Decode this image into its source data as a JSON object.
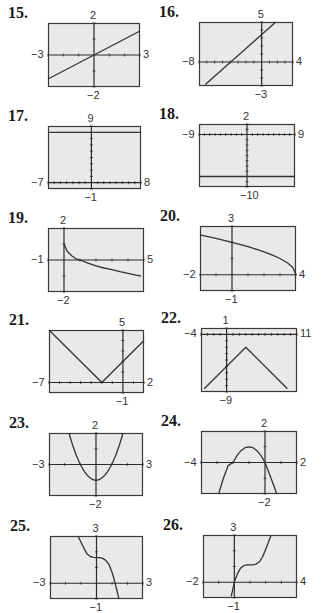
{
  "chart_data": [
    {
      "id": "15",
      "type": "line",
      "number": "15.",
      "window": {
        "xmin": -3,
        "xmax": 3,
        "ymin": -2,
        "ymax": 2
      },
      "labels": {
        "top": "2",
        "bottom": "−2",
        "left": "−3",
        "right": "3"
      },
      "frame": [
        48,
        23,
        92,
        64
      ],
      "curve": "linear",
      "points": [
        [
          -3,
          -1.5
        ],
        [
          3,
          1.5
        ]
      ]
    },
    {
      "id": "16",
      "type": "line",
      "number": "16.",
      "window": {
        "xmin": -8,
        "xmax": 4,
        "ymin": -3,
        "ymax": 5
      },
      "labels": {
        "top": "5",
        "bottom": "−3",
        "left": "−8",
        "right": "4"
      },
      "frame": [
        199,
        22,
        94,
        64
      ],
      "curve": "linear",
      "points": [
        [
          -7.2,
          -2.8
        ],
        [
          1.8,
          5
        ]
      ]
    },
    {
      "id": "17",
      "type": "line",
      "number": "17.",
      "window": {
        "xmin": -7,
        "xmax": 8,
        "ymin": -1,
        "ymax": 9
      },
      "labels": {
        "top": "9",
        "bottom": "−1",
        "left": "−7",
        "right": "8"
      },
      "frame": [
        48,
        126,
        93,
        63
      ],
      "curve": "linear",
      "points": [
        [
          -7,
          8
        ],
        [
          8,
          8
        ]
      ]
    },
    {
      "id": "18",
      "type": "line",
      "number": "18.",
      "window": {
        "xmin": -9,
        "xmax": 9,
        "ymin": -10,
        "ymax": 2
      },
      "labels": {
        "top": "2",
        "bottom": "−10",
        "left": "−9",
        "right": "9"
      },
      "frame": [
        199,
        124,
        96,
        63
      ],
      "curve": "linear",
      "points": [
        [
          -9,
          -8
        ],
        [
          9,
          -8
        ]
      ]
    },
    {
      "id": "19",
      "type": "line",
      "number": "19.",
      "window": {
        "xmin": -1,
        "xmax": 5,
        "ymin": -2,
        "ymax": 2
      },
      "labels": {
        "top": "2",
        "bottom": "−2",
        "left": "−1",
        "right": "5"
      },
      "frame": [
        48,
        228,
        96,
        64
      ],
      "curve": "points",
      "points": [
        [
          0,
          1
        ],
        [
          0.2,
          0.55
        ],
        [
          0.5,
          0.25
        ],
        [
          0.8,
          0.05
        ],
        [
          1,
          0
        ],
        [
          1.5,
          -0.2
        ],
        [
          2,
          -0.36
        ],
        [
          2.5,
          -0.5
        ],
        [
          3,
          -0.6
        ],
        [
          3.5,
          -0.73
        ],
        [
          4,
          -0.83
        ],
        [
          4.5,
          -0.95
        ],
        [
          4.8,
          -1
        ]
      ]
    },
    {
      "id": "20",
      "type": "line",
      "number": "20.",
      "window": {
        "xmin": -2,
        "xmax": 4,
        "ymin": -1,
        "ymax": 3
      },
      "labels": {
        "top": "3",
        "bottom": "−1",
        "left": "−2",
        "right": "4"
      },
      "frame": [
        200,
        226,
        96,
        65
      ],
      "curve": "points",
      "points": [
        [
          -2,
          2.45
        ],
        [
          -1,
          2.24
        ],
        [
          0,
          2
        ],
        [
          1,
          1.73
        ],
        [
          1.5,
          1.58
        ],
        [
          2,
          1.41
        ],
        [
          2.5,
          1.22
        ],
        [
          3,
          1
        ],
        [
          3.5,
          0.71
        ],
        [
          3.8,
          0.45
        ],
        [
          4,
          0
        ]
      ]
    },
    {
      "id": "21",
      "type": "line",
      "number": "21.",
      "window": {
        "xmin": -7,
        "xmax": 2,
        "ymin": -1,
        "ymax": 5
      },
      "labels": {
        "top": "5",
        "bottom": "−1",
        "left": "−7",
        "right": "2"
      },
      "frame": [
        49,
        330,
        95,
        63
      ],
      "curve": "linear",
      "points": [
        [
          -7,
          5
        ],
        [
          -2,
          0
        ],
        [
          2,
          4
        ]
      ]
    },
    {
      "id": "22",
      "type": "line",
      "number": "22.",
      "window": {
        "xmin": -4,
        "xmax": 11,
        "ymin": -9,
        "ymax": 1
      },
      "labels": {
        "top": "1",
        "bottom": "−9",
        "left": "−4",
        "right": "11"
      },
      "frame": [
        201,
        328,
        96,
        64
      ],
      "curve": "linear",
      "points": [
        [
          -3.5,
          -8.5
        ],
        [
          3,
          -2
        ],
        [
          9.5,
          -8.5
        ]
      ]
    },
    {
      "id": "23",
      "type": "line",
      "number": "23.",
      "window": {
        "xmin": -3,
        "xmax": 3,
        "ymin": -2,
        "ymax": 2
      },
      "labels": {
        "top": "2",
        "bottom": "−2",
        "left": "−3",
        "right": "3"
      },
      "frame": [
        49,
        433,
        94,
        63
      ],
      "curve": "points",
      "points": [
        [
          -1.73,
          2
        ],
        [
          -1.5,
          1.25
        ],
        [
          -1.25,
          0.56
        ],
        [
          -1,
          0
        ],
        [
          -0.75,
          -0.44
        ],
        [
          -0.5,
          -0.75
        ],
        [
          -0.25,
          -0.94
        ],
        [
          0,
          -1
        ],
        [
          0.25,
          -0.94
        ],
        [
          0.5,
          -0.75
        ],
        [
          0.75,
          -0.44
        ],
        [
          1,
          0
        ],
        [
          1.25,
          0.56
        ],
        [
          1.5,
          1.25
        ],
        [
          1.73,
          2
        ]
      ]
    },
    {
      "id": "24",
      "type": "line",
      "number": "24.",
      "window": {
        "xmin": -4,
        "xmax": 2,
        "ymin": -2,
        "ymax": 2
      },
      "labels": {
        "top": "2",
        "bottom": "−2",
        "left": "−4",
        "right": "2"
      },
      "frame": [
        201,
        431,
        96,
        63
      ],
      "curve": "points",
      "points": [
        [
          -2.9,
          -2
        ],
        [
          -2.6,
          -1
        ],
        [
          -2.3,
          -0.2
        ],
        [
          -2,
          0
        ],
        [
          -1.75,
          0.44
        ],
        [
          -1.5,
          0.75
        ],
        [
          -1.25,
          0.94
        ],
        [
          -1,
          1
        ],
        [
          -0.75,
          0.94
        ],
        [
          -0.5,
          0.75
        ],
        [
          -0.25,
          0.44
        ],
        [
          0,
          0
        ],
        [
          0.3,
          -0.8
        ],
        [
          0.6,
          -1.6
        ],
        [
          0.73,
          -2
        ]
      ]
    },
    {
      "id": "25",
      "type": "line",
      "number": "25.",
      "window": {
        "xmin": -3,
        "xmax": 3,
        "ymin": -1,
        "ymax": 3
      },
      "labels": {
        "top": "3",
        "bottom": "−1",
        "left": "−3",
        "right": "3"
      },
      "frame": [
        50,
        536,
        93,
        63
      ],
      "curve": "points",
      "points": [
        [
          -1.2,
          3
        ],
        [
          -1,
          2.6
        ],
        [
          -0.8,
          2.2
        ],
        [
          -0.6,
          1.85
        ],
        [
          -0.4,
          1.7
        ],
        [
          -0.2,
          1.65
        ],
        [
          0,
          1.63
        ],
        [
          0.2,
          1.62
        ],
        [
          0.4,
          1.58
        ],
        [
          0.6,
          1.45
        ],
        [
          0.8,
          1.2
        ],
        [
          1,
          0.7
        ],
        [
          1.1,
          0.4
        ],
        [
          1.2,
          0
        ],
        [
          1.3,
          -0.4
        ],
        [
          1.4,
          -0.8
        ],
        [
          1.45,
          -1
        ]
      ]
    },
    {
      "id": "26",
      "type": "line",
      "number": "26.",
      "window": {
        "xmin": -2,
        "xmax": 4,
        "ymin": -1,
        "ymax": 3
      },
      "labels": {
        "top": "3",
        "bottom": "−1",
        "left": "−2",
        "right": "4"
      },
      "frame": [
        203,
        535,
        94,
        63
      ],
      "curve": "points",
      "points": [
        [
          -0.2,
          -0.9
        ],
        [
          -0.1,
          -0.45
        ],
        [
          0,
          0
        ],
        [
          0.2,
          0.55
        ],
        [
          0.4,
          0.9
        ],
        [
          0.6,
          1.05
        ],
        [
          0.8,
          1.1
        ],
        [
          1,
          1.1
        ],
        [
          1.2,
          1.1
        ],
        [
          1.4,
          1.15
        ],
        [
          1.6,
          1.3
        ],
        [
          1.8,
          1.6
        ],
        [
          2,
          2.1
        ],
        [
          2.2,
          2.6
        ],
        [
          2.35,
          3
        ]
      ]
    }
  ],
  "style": {
    "frame_fill": "#e9e9e9",
    "frame_stroke": "#3a3a3a",
    "axis_color": "#2a2a2a",
    "curve_color": "#333333"
  }
}
